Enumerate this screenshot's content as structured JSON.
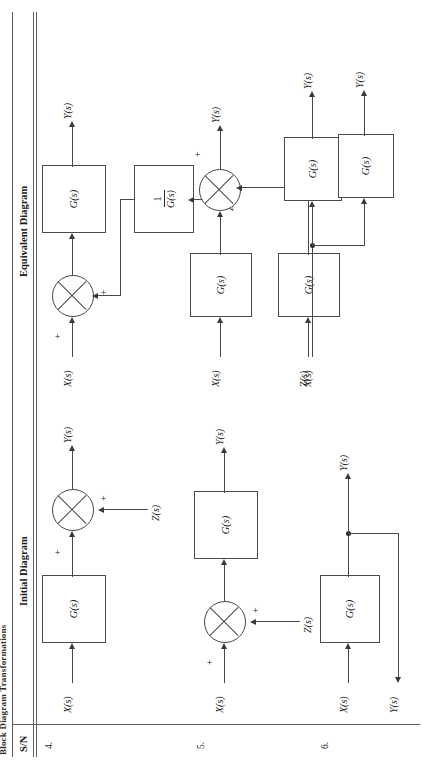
{
  "document": {
    "caption": "Block Diagram Transformations",
    "orientation_degrees": 90
  },
  "table": {
    "columns": [
      {
        "key": "sn",
        "label": "S/N"
      },
      {
        "key": "initial",
        "label": "Initial Diagram"
      },
      {
        "key": "equivalent",
        "label": "Equivalent Diagram"
      }
    ],
    "rows": [
      {
        "sn": "4.",
        "initial": {
          "signals": {
            "input": "X(s)",
            "output": "Y(s)",
            "aux": "Z(s)"
          },
          "blocks": [
            "G(s)"
          ],
          "signs": {
            "forward": "+",
            "aux": "+"
          }
        },
        "equivalent": {
          "signals": {
            "input": "X(s)",
            "output": "Y(s)",
            "aux": "Z(s)"
          },
          "blocks": [
            "G(s)"
          ],
          "fraction": {
            "numerator": "1",
            "denominator": "G(s)"
          },
          "signs": {
            "forward": "+",
            "aux": "+"
          }
        }
      },
      {
        "sn": "5.",
        "initial": {
          "signals": {
            "input": "X(s)",
            "output": "Y(s)",
            "aux": "Z(s)"
          },
          "blocks": [
            "G(s)"
          ],
          "signs": {
            "forward": "+",
            "aux": "+"
          }
        },
        "equivalent": {
          "signals": {
            "input": "X(s)",
            "output": "Y(s)",
            "aux": "Z(s)"
          },
          "blocks": [
            "G(s)",
            "G(s)"
          ],
          "signs": {
            "forward": "+",
            "aux": "+"
          }
        }
      },
      {
        "sn": "6.",
        "initial": {
          "signals": {
            "input": "X(s)",
            "output_top": "Y(s)",
            "output_branch": "Y(s)"
          },
          "blocks": [
            "G(s)"
          ]
        },
        "equivalent": {
          "signals": {
            "input": "X(s)",
            "output_top": "Y(s)",
            "output_branch": "Y(s)"
          },
          "blocks": [
            "G(s)",
            "G(s)"
          ]
        }
      }
    ]
  },
  "colors": {
    "ink": "#1c1c1c",
    "rule": "#5d5d5d",
    "line": "#4a4a4a",
    "paper": "#ffffff"
  }
}
